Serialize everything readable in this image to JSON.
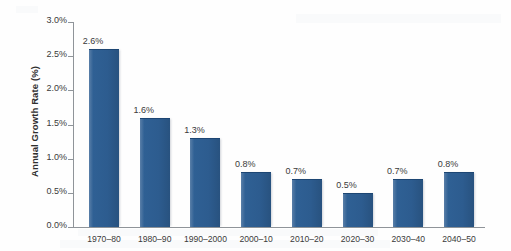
{
  "chart_data": {
    "type": "bar",
    "title": "",
    "xlabel": "",
    "ylabel": "Annual Growth Rate (%)",
    "categories": [
      "1970–80",
      "1980–90",
      "1990–2000",
      "2000–10",
      "2010–20",
      "2020–30",
      "2030–40",
      "2040–50"
    ],
    "values": [
      2.6,
      1.6,
      1.3,
      0.8,
      0.7,
      0.5,
      0.7,
      0.8
    ],
    "data_labels": [
      "2.6%",
      "1.6%",
      "1.3%",
      "0.8%",
      "0.7%",
      "0.5%",
      "0.7%",
      "0.8%"
    ],
    "ylim": [
      0.0,
      3.0
    ],
    "ytick_values": [
      0.0,
      0.5,
      1.0,
      1.5,
      2.0,
      2.5,
      3.0
    ],
    "ytick_labels": [
      "0.0%",
      "0.5%",
      "1.0%",
      "1.5%",
      "2.0%",
      "2.5%",
      "3.0%"
    ],
    "grid": false,
    "legend": null,
    "series_color": "#2d5c8f",
    "axis_color": "#8f9499",
    "text_color": "#3a3a3a"
  }
}
